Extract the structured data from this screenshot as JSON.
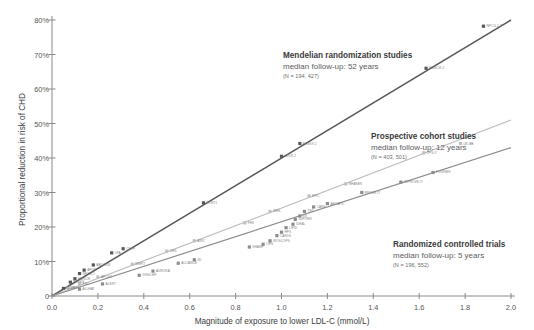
{
  "chart_data": {
    "type": "scatter",
    "title": "",
    "xlabel": "Magnitude of exposure to lower LDL-C (mmol/L)",
    "ylabel": "Proportional reduction in risk of CHD",
    "xlim": [
      0.0,
      2.0
    ],
    "ylim": [
      0.0,
      0.8
    ],
    "xticks": [
      "0.0",
      "0.2",
      "0.4",
      "0.6",
      "0.8",
      "1.0",
      "1.2",
      "1.4",
      "1.6",
      "1.8",
      "2.0"
    ],
    "xtick_values": [
      0.0,
      0.2,
      0.4,
      0.6,
      0.8,
      1.0,
      1.2,
      1.4,
      1.6,
      1.8,
      2.0
    ],
    "yticks": [
      "0",
      "10%",
      "20%",
      "30%",
      "40%",
      "50%",
      "60%",
      "70%",
      "80%"
    ],
    "ytick_values": [
      0.0,
      0.1,
      0.2,
      0.3,
      0.4,
      0.5,
      0.6,
      0.7,
      0.8
    ],
    "grid": false,
    "legend_position": "inline-annotations",
    "series": [
      {
        "name": "Mendelian randomization studies",
        "color": "#58585a",
        "slope_per_mmol": 0.4,
        "line": {
          "x0": 0.0,
          "y0": 0.0,
          "x1": 2.0,
          "y1": 0.8
        },
        "points": [
          {
            "x": 0.05,
            "y": 0.022,
            "label": "LDLR"
          },
          {
            "x": 0.08,
            "y": 0.04,
            "label": "PCSK9"
          },
          {
            "x": 0.1,
            "y": 0.05,
            "label": "HMGCR"
          },
          {
            "x": 0.12,
            "y": 0.065,
            "label": "NPC1L1"
          },
          {
            "x": 0.14,
            "y": 0.075,
            "label": "APOE"
          },
          {
            "x": 0.18,
            "y": 0.09,
            "label": "ABCG5/8"
          },
          {
            "x": 0.26,
            "y": 0.125,
            "label": "LPA"
          },
          {
            "x": 0.31,
            "y": 0.137,
            "label": "CETP"
          },
          {
            "x": 0.66,
            "y": 0.27,
            "label": "SORT1"
          },
          {
            "x": 1.0,
            "y": 0.405,
            "label": "LDLR-2"
          },
          {
            "x": 1.08,
            "y": 0.442,
            "label": "PCSK9-2"
          },
          {
            "x": 1.63,
            "y": 0.66,
            "label": "HMGCR-2"
          },
          {
            "x": 1.88,
            "y": 0.782,
            "label": "NPC1L1-2"
          }
        ]
      },
      {
        "name": "Prospective cohort studies",
        "color": "#bfbfbf",
        "slope_per_mmol": 0.255,
        "line": {
          "x0": 0.0,
          "y0": 0.0,
          "x1": 2.0,
          "y1": 0.51
        },
        "points": [
          {
            "x": 0.07,
            "y": 0.022,
            "label": "ERFC"
          },
          {
            "x": 0.12,
            "y": 0.035,
            "label": "PSC"
          },
          {
            "x": 0.2,
            "y": 0.055,
            "label": "APCSC"
          },
          {
            "x": 0.35,
            "y": 0.092,
            "label": "MRFIT"
          },
          {
            "x": 0.5,
            "y": 0.13,
            "label": "CHS"
          },
          {
            "x": 0.62,
            "y": 0.16,
            "label": "ARIC"
          },
          {
            "x": 0.84,
            "y": 0.212,
            "label": "FHS"
          },
          {
            "x": 0.95,
            "y": 0.245,
            "label": "WHS"
          },
          {
            "x": 1.12,
            "y": 0.29,
            "label": "EPIC"
          },
          {
            "x": 1.28,
            "y": 0.325,
            "label": "NHANES"
          },
          {
            "x": 1.62,
            "y": 0.415,
            "label": "CPS-II"
          },
          {
            "x": 1.78,
            "y": 0.442,
            "label": "UK-BB"
          }
        ]
      },
      {
        "name": "Randomized controlled trials",
        "color": "#8c8c8e",
        "slope_per_mmol": 0.215,
        "line": {
          "x0": 0.0,
          "y0": 0.0,
          "x1": 2.0,
          "y1": 0.43
        },
        "points": [
          {
            "x": 0.12,
            "y": 0.02,
            "label": "ALLHAT"
          },
          {
            "x": 0.22,
            "y": 0.035,
            "label": "ALERT"
          },
          {
            "x": 0.38,
            "y": 0.06,
            "label": "GISSI-HF"
          },
          {
            "x": 0.44,
            "y": 0.072,
            "label": "AURORA"
          },
          {
            "x": 0.55,
            "y": 0.095,
            "label": "ALLIANCE"
          },
          {
            "x": 0.62,
            "y": 0.105,
            "label": "4D"
          },
          {
            "x": 0.86,
            "y": 0.142,
            "label": "SHARP"
          },
          {
            "x": 0.92,
            "y": 0.15,
            "label": "LIPS"
          },
          {
            "x": 0.95,
            "y": 0.16,
            "label": "WOSCOPS"
          },
          {
            "x": 0.98,
            "y": 0.175,
            "label": "CARDS"
          },
          {
            "x": 1.0,
            "y": 0.185,
            "label": "HPS"
          },
          {
            "x": 1.02,
            "y": 0.198,
            "label": "LIPID"
          },
          {
            "x": 1.05,
            "y": 0.208,
            "label": "IDEAL"
          },
          {
            "x": 1.06,
            "y": 0.222,
            "label": "JUPITER"
          },
          {
            "x": 1.08,
            "y": 0.232,
            "label": "4S"
          },
          {
            "x": 1.1,
            "y": 0.245,
            "label": "TNT"
          },
          {
            "x": 1.14,
            "y": 0.258,
            "label": "CARE"
          },
          {
            "x": 1.2,
            "y": 0.268,
            "label": "AFCAPS"
          },
          {
            "x": 1.35,
            "y": 0.3,
            "label": "PROVE-IT"
          },
          {
            "x": 1.52,
            "y": 0.33,
            "label": "IMPROVE-IT"
          },
          {
            "x": 1.66,
            "y": 0.358,
            "label": "FOURIER"
          }
        ]
      }
    ],
    "annotations": [
      {
        "name": "mendelian-randomization",
        "title": "Mendelian randomization studies",
        "subtitle": "median follow-up: 52 years",
        "n": "(N = 194, 427)"
      },
      {
        "name": "prospective-cohort",
        "title": "Prospective cohort studies",
        "subtitle": "median follow-up: 12 years",
        "n": "(N = 403, 501)"
      },
      {
        "name": "randomized-controlled-trials",
        "title": "Randomized controlled trials",
        "subtitle": "median follow-up: 5 years",
        "n": "(N = 196, 552)"
      }
    ],
    "colors": {
      "mendelian": "#58585a",
      "cohort": "#bfbfbf",
      "rct": "#8c8c8e",
      "axis": "#8a8a8a",
      "text": "#4a4a4a"
    }
  }
}
